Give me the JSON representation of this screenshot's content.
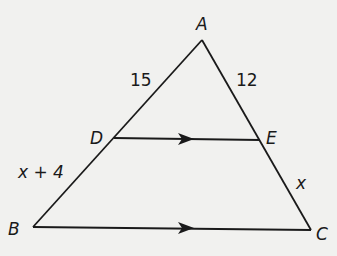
{
  "diagram": {
    "type": "triangle-with-parallel-segment",
    "vertices": {
      "A": {
        "label": "A"
      },
      "B": {
        "label": "B"
      },
      "C": {
        "label": "C"
      },
      "D": {
        "label": "D"
      },
      "E": {
        "label": "E"
      }
    },
    "segment_labels": {
      "AD": "15",
      "AE": "12",
      "DB": "x + 4",
      "EC": "x"
    },
    "parallel": [
      "DE",
      "BC"
    ],
    "colors": {
      "stroke": "#1a1a1a",
      "background": "#f1f1ef"
    }
  }
}
